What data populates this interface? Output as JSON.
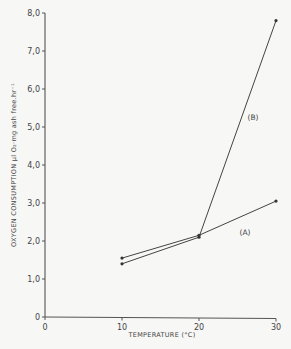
{
  "chart_data": {
    "type": "line",
    "title": "",
    "xlabel": "TEMPERATURE (°C)",
    "ylabel": "OXYGEN CONSUMPTION µl O₂·mg ash free.hr⁻¹",
    "x_ticks": [
      "0",
      "10",
      "20",
      "30"
    ],
    "y_ticks": [
      "0",
      "1,0",
      "2,0",
      "3,0",
      "4,0",
      "5,0",
      "6,0",
      "7,0",
      "8,0"
    ],
    "xlim": [
      0,
      30
    ],
    "ylim": [
      0,
      8
    ],
    "grid": false,
    "legend": "inline labels",
    "x": [
      10,
      20,
      30
    ],
    "series": [
      {
        "name": "(A)",
        "values": [
          1.55,
          2.15,
          3.05
        ]
      },
      {
        "name": "(B)",
        "values": [
          1.4,
          2.1,
          7.8
        ]
      }
    ]
  }
}
